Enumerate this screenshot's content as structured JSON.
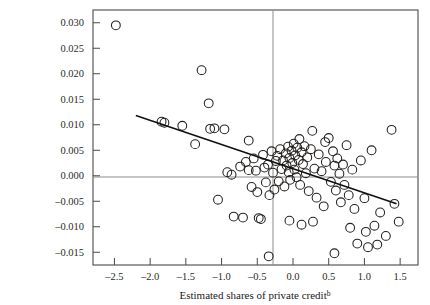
{
  "figure": {
    "background": "#ffffff",
    "frame_color": "#4a4a4a",
    "marker_color": "#23201e",
    "trend_color": "#0f0f0f",
    "zeroline_color": "#8d8d8d"
  },
  "chart_data": {
    "type": "scatter",
    "title": "",
    "xlabel": "Estimated shares of private credit",
    "xlabel_superscript": "b",
    "ylabel": "",
    "xlim": [
      -2.8,
      1.75
    ],
    "ylim": [
      -0.0175,
      0.0325
    ],
    "xticks": [
      -2.5,
      -2.0,
      -1.5,
      -1.0,
      -0.5,
      0.0,
      0.5,
      1.0,
      1.5
    ],
    "xtick_labels": [
      "–2.5",
      "–2.0",
      "–1.5",
      "–1.0",
      "–0.5",
      "0.0",
      "0.5",
      "1.0",
      "1.5"
    ],
    "yticks": [
      0.03,
      0.025,
      0.02,
      0.015,
      0.01,
      0.005,
      0.0,
      -0.005,
      -0.01,
      -0.015
    ],
    "ytick_labels": [
      "0.030",
      "0.025",
      "0.020",
      "0.015",
      "0.010",
      "0.005",
      "0.000",
      "–0.005",
      "–0.010",
      "–0.015"
    ],
    "grid": false,
    "legend": null,
    "zero_lines": {
      "horizontal_y": 0.0,
      "vertical_x": 0.0
    },
    "trend_line": {
      "x": [
        -2.2,
        1.45
      ],
      "y": [
        0.0118,
        -0.0055
      ],
      "slope": -0.00474,
      "intercept": 0.00137
    },
    "points": [
      [
        -2.48,
        0.0295
      ],
      [
        -1.84,
        0.0106
      ],
      [
        -1.8,
        0.0104
      ],
      [
        -1.37,
        0.0062
      ],
      [
        -1.28,
        0.0207
      ],
      [
        -1.18,
        0.0142
      ],
      [
        -1.16,
        0.0092
      ],
      [
        -1.1,
        0.0093
      ],
      [
        -1.05,
        -0.0047
      ],
      [
        -0.96,
        0.0091
      ],
      [
        -0.92,
        0.0007
      ],
      [
        -0.86,
        0.0002
      ],
      [
        -0.83,
        -0.008
      ],
      [
        -0.74,
        0.0018
      ],
      [
        -0.7,
        -0.0082
      ],
      [
        -0.66,
        0.0027
      ],
      [
        -0.62,
        0.0011
      ],
      [
        -0.58,
        -0.0022
      ],
      [
        -0.55,
        0.0034
      ],
      [
        -0.52,
        0.001
      ],
      [
        -0.5,
        -0.0032
      ],
      [
        -0.48,
        -0.0083
      ],
      [
        -0.45,
        -0.0085
      ],
      [
        -0.42,
        0.0041
      ],
      [
        -0.4,
        0.0016
      ],
      [
        -0.38,
        -0.0013
      ],
      [
        -0.35,
        0.0022
      ],
      [
        -0.33,
        -0.0038
      ],
      [
        -0.3,
        0.0048
      ],
      [
        -0.28,
        0.0006
      ],
      [
        -0.26,
        -0.0027
      ],
      [
        -0.24,
        0.0029
      ],
      [
        -0.22,
        0.0039
      ],
      [
        -0.2,
        -0.0011
      ],
      [
        -0.18,
        0.0052
      ],
      [
        -0.16,
        0.0013
      ],
      [
        -0.14,
        0.003
      ],
      [
        -0.12,
        -0.0021
      ],
      [
        -0.1,
        0.0044
      ],
      [
        -0.09,
        0.002
      ],
      [
        -0.07,
        0.0057
      ],
      [
        -0.06,
        0.0007
      ],
      [
        -0.05,
        0.0035
      ],
      [
        -0.04,
        -0.0008
      ],
      [
        -0.02,
        0.0049
      ],
      [
        -0.01,
        0.0025
      ],
      [
        0.01,
        0.0063
      ],
      [
        0.02,
        0.0012
      ],
      [
        0.03,
        0.004
      ],
      [
        0.05,
        -0.0003
      ],
      [
        0.06,
        0.0055
      ],
      [
        0.08,
        0.0031
      ],
      [
        0.09,
        0.0072
      ],
      [
        0.1,
        -0.0018
      ],
      [
        0.12,
        0.0046
      ],
      [
        0.14,
        0.0023
      ],
      [
        0.16,
        0.0058
      ],
      [
        0.18,
        0.0005
      ],
      [
        0.2,
        0.0036
      ],
      [
        0.22,
        -0.003
      ],
      [
        0.25,
        0.0052
      ],
      [
        0.27,
        0.0088
      ],
      [
        0.3,
        0.0014
      ],
      [
        0.33,
        -0.0043
      ],
      [
        0.36,
        0.0042
      ],
      [
        0.4,
        0.0009
      ],
      [
        0.43,
        -0.006
      ],
      [
        0.46,
        0.0027
      ],
      [
        0.5,
        0.0074
      ],
      [
        0.53,
        -0.0012
      ],
      [
        0.56,
        0.0048
      ],
      [
        0.58,
        0.002
      ],
      [
        0.6,
        -0.0029
      ],
      [
        0.62,
        0.0034
      ],
      [
        0.65,
        0.0004
      ],
      [
        0.67,
        -0.0052
      ],
      [
        0.7,
        0.0022
      ],
      [
        0.72,
        -0.0018
      ],
      [
        0.75,
        0.006
      ],
      [
        0.78,
        -0.0038
      ],
      [
        0.8,
        -0.0102
      ],
      [
        0.83,
        0.0012
      ],
      [
        0.86,
        -0.0065
      ],
      [
        0.9,
        -0.0133
      ],
      [
        0.95,
        0.003
      ],
      [
        1.0,
        -0.0044
      ],
      [
        1.02,
        -0.011
      ],
      [
        1.05,
        -0.014
      ],
      [
        1.1,
        0.005
      ],
      [
        1.14,
        -0.0098
      ],
      [
        1.18,
        -0.0135
      ],
      [
        1.22,
        -0.0072
      ],
      [
        1.3,
        -0.0118
      ],
      [
        1.38,
        0.009
      ],
      [
        1.42,
        -0.0055
      ],
      [
        1.48,
        -0.009
      ],
      [
        -0.34,
        -0.0158
      ],
      [
        0.58,
        -0.0152
      ],
      [
        -1.55,
        0.0098
      ],
      [
        0.28,
        -0.009
      ],
      [
        -0.05,
        -0.0088
      ],
      [
        0.12,
        -0.0096
      ],
      [
        0.45,
        0.0066
      ],
      [
        -0.62,
        0.0069
      ]
    ]
  }
}
